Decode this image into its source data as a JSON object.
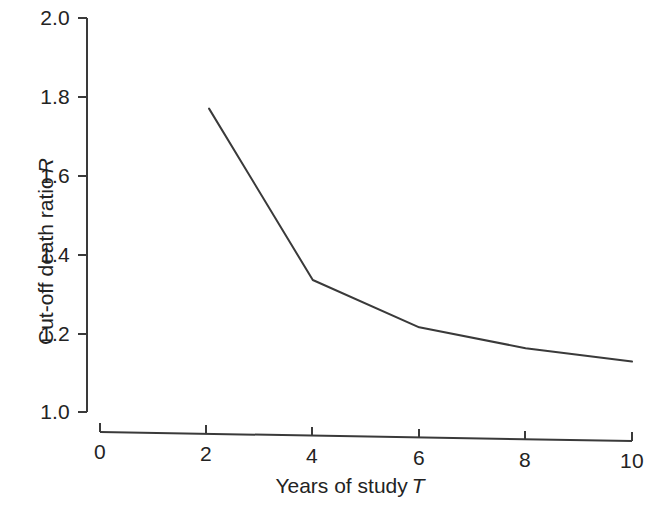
{
  "chart_data": {
    "type": "line",
    "title": "",
    "subtitle": "",
    "xlabel": "Years of study",
    "xlabel_symbol": "T",
    "ylabel": "Cut-off death ratio",
    "ylabel_symbol": "R",
    "xlim": [
      0,
      10
    ],
    "ylim": [
      1.0,
      2.0
    ],
    "xticks": [
      0,
      2,
      4,
      6,
      8,
      10
    ],
    "xtick_labels": [
      "0",
      "2",
      "4",
      "6",
      "8",
      "10"
    ],
    "yticks": [
      1.0,
      1.2,
      1.4,
      1.6,
      1.8,
      2.0
    ],
    "ytick_labels": [
      "1.0",
      "1.2",
      "1.4",
      "1.6",
      "1.8",
      "2.0"
    ],
    "grid": false,
    "legend": null,
    "line_color": "#3a3a3a",
    "series": [
      {
        "name": "Cut-off death ratio",
        "x": [
          2.05,
          4.0,
          6.0,
          8.0,
          10.0
        ],
        "values": [
          1.77,
          1.335,
          1.215,
          1.162,
          1.128
        ]
      }
    ]
  },
  "axes": {
    "x_title_display": "Years of study",
    "x_title_symbol": "T",
    "y_title_display": "Cut-off death ratio",
    "y_title_symbol": "R"
  }
}
